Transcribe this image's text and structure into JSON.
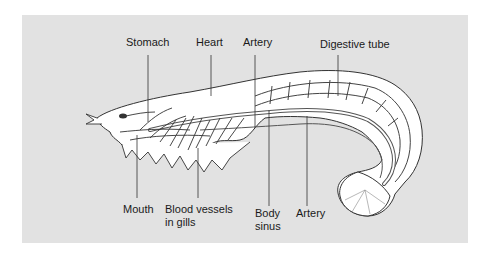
{
  "figure": {
    "background_color": "#e2e2e2",
    "body_fill": "#ffffff",
    "line_color": "#333333"
  },
  "labels": {
    "top": [
      {
        "id": "stomach",
        "text": "Stomach"
      },
      {
        "id": "heart",
        "text": "Heart"
      },
      {
        "id": "artery_top",
        "text": "Artery"
      },
      {
        "id": "digestive_tube",
        "text": "Digestive tube"
      }
    ],
    "bottom": [
      {
        "id": "mouth",
        "text": "Mouth"
      },
      {
        "id": "blood_vessels_line1",
        "text": "Blood vessels"
      },
      {
        "id": "blood_vessels_line2",
        "text": "in gills"
      },
      {
        "id": "body_sinus_line1",
        "text": "Body"
      },
      {
        "id": "body_sinus_line2",
        "text": "sinus"
      },
      {
        "id": "artery_bottom",
        "text": "Artery"
      }
    ]
  }
}
